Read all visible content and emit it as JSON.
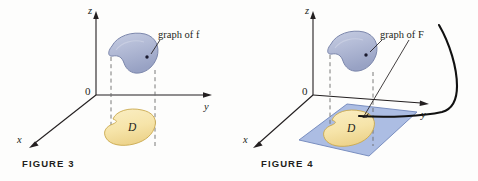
{
  "document": {
    "background_color": "#fdfdfc",
    "ink_color": "#231f20"
  },
  "palette": {
    "surface_blue_fill": "#b3bbd6",
    "surface_blue_edge": "#7b86ab",
    "surface_blue_shade": "#98a2c4",
    "region_yellow_fill": "#f6e4a9",
    "region_yellow_edge": "#c9a84c",
    "plane_blue_fill": "#9db2de",
    "plane_blue_edge": "#6f86ba",
    "axis_color": "#231f20",
    "dashed_color": "#6b6b6b",
    "curve_color": "#111111"
  },
  "figures": [
    {
      "id": "figure-3",
      "caption": "FIGURE 3",
      "axes": {
        "z_label": "z",
        "y_label": "y",
        "x_label": "x",
        "origin_label": "0"
      },
      "annotations": [
        {
          "id": "graph-of-f",
          "text": "graph of f",
          "pointer": true
        }
      ],
      "regions": [
        {
          "id": "surface-f",
          "label": "",
          "color": "#b3bbd6",
          "kind": "surface"
        },
        {
          "id": "domain-d",
          "label": "D",
          "color": "#f6e4a9",
          "kind": "planar-region"
        }
      ],
      "has_plane": false,
      "has_curve": false
    },
    {
      "id": "figure-4",
      "caption": "FIGURE 4",
      "axes": {
        "z_label": "z",
        "y_label": "y",
        "x_label": "x",
        "origin_label": "0"
      },
      "annotations": [
        {
          "id": "graph-of-F",
          "text": "graph of F",
          "pointer": true
        }
      ],
      "regions": [
        {
          "id": "surface-F",
          "label": "",
          "color": "#b3bbd6",
          "kind": "surface"
        },
        {
          "id": "domain-d",
          "label": "D",
          "color": "#f6e4a9",
          "kind": "planar-region"
        },
        {
          "id": "rectangle-plane",
          "label": "",
          "color": "#9db2de",
          "kind": "plane"
        }
      ],
      "has_plane": true,
      "has_curve": true
    }
  ],
  "figure3": {
    "caption": "FIGURE 3",
    "z_label": "z",
    "y_label": "y",
    "x_label": "x",
    "origin_label": "0",
    "graph_label": "graph of f",
    "region_label": "D"
  },
  "figure4": {
    "caption": "FIGURE 4",
    "z_label": "z",
    "y_label": "y",
    "x_label": "x",
    "origin_label": "0",
    "graph_label": "graph of F",
    "region_label": "D"
  }
}
